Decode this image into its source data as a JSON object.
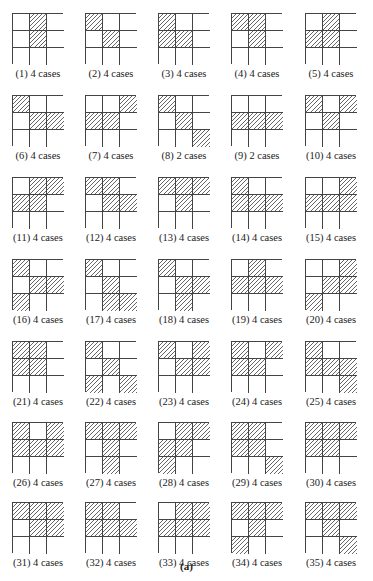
{
  "figure": {
    "caption": "(a)",
    "grid_size": 3,
    "hatch_color": "#666666",
    "line_color": "#444444",
    "panels": [
      {
        "label": "(1) 4 cases",
        "hatched": [
          [
            0,
            1
          ],
          [
            1,
            1
          ]
        ]
      },
      {
        "label": "(2) 4 cases",
        "hatched": [
          [
            0,
            0
          ],
          [
            1,
            1
          ]
        ]
      },
      {
        "label": "(3) 4 cases",
        "hatched": [
          [
            0,
            0
          ],
          [
            1,
            0
          ],
          [
            1,
            1
          ]
        ]
      },
      {
        "label": "(4) 4 cases",
        "hatched": [
          [
            0,
            0
          ],
          [
            0,
            1
          ],
          [
            1,
            1
          ]
        ]
      },
      {
        "label": "(5) 4 cases",
        "hatched": [
          [
            0,
            1
          ],
          [
            1,
            0
          ],
          [
            1,
            1
          ]
        ]
      },
      {
        "label": "(6) 4 cases",
        "hatched": [
          [
            0,
            0
          ],
          [
            1,
            1
          ],
          [
            1,
            2
          ]
        ]
      },
      {
        "label": "(7) 4 cases",
        "hatched": [
          [
            0,
            2
          ],
          [
            1,
            0
          ],
          [
            1,
            1
          ]
        ]
      },
      {
        "label": "(8) 2 cases",
        "hatched": [
          [
            0,
            0
          ],
          [
            1,
            1
          ],
          [
            2,
            2
          ]
        ]
      },
      {
        "label": "(9) 2 cases",
        "hatched": [
          [
            1,
            0
          ],
          [
            1,
            1
          ],
          [
            1,
            2
          ]
        ]
      },
      {
        "label": "(10) 4 cases",
        "hatched": [
          [
            0,
            0
          ],
          [
            0,
            2
          ],
          [
            1,
            1
          ]
        ]
      },
      {
        "label": "(11) 4 cases",
        "hatched": [
          [
            0,
            1
          ],
          [
            0,
            2
          ],
          [
            1,
            0
          ],
          [
            1,
            1
          ]
        ]
      },
      {
        "label": "(12) 4 cases",
        "hatched": [
          [
            0,
            0
          ],
          [
            0,
            1
          ],
          [
            1,
            1
          ],
          [
            1,
            2
          ]
        ]
      },
      {
        "label": "(13) 4 cases",
        "hatched": [
          [
            0,
            0
          ],
          [
            0,
            1
          ],
          [
            0,
            2
          ],
          [
            1,
            1
          ]
        ]
      },
      {
        "label": "(14) 4 cases",
        "hatched": [
          [
            0,
            0
          ],
          [
            1,
            0
          ],
          [
            1,
            1
          ],
          [
            1,
            2
          ]
        ]
      },
      {
        "label": "(15) 4 cases",
        "hatched": [
          [
            0,
            2
          ],
          [
            1,
            0
          ],
          [
            1,
            1
          ],
          [
            1,
            2
          ]
        ]
      },
      {
        "label": "(16) 4 cases",
        "hatched": [
          [
            0,
            0
          ],
          [
            1,
            1
          ],
          [
            1,
            2
          ],
          [
            2,
            0
          ]
        ]
      },
      {
        "label": "(17) 4 cases",
        "hatched": [
          [
            0,
            0
          ],
          [
            1,
            1
          ],
          [
            2,
            1
          ],
          [
            2,
            2
          ]
        ]
      },
      {
        "label": "(18) 4 cases",
        "hatched": [
          [
            0,
            0
          ],
          [
            1,
            1
          ],
          [
            1,
            2
          ],
          [
            2,
            1
          ]
        ]
      },
      {
        "label": "(19) 4 cases",
        "hatched": [
          [
            0,
            1
          ],
          [
            1,
            0
          ],
          [
            1,
            1
          ],
          [
            1,
            2
          ]
        ]
      },
      {
        "label": "(20) 4 cases",
        "hatched": [
          [
            0,
            2
          ],
          [
            1,
            1
          ],
          [
            1,
            2
          ],
          [
            2,
            0
          ]
        ]
      },
      {
        "label": "(21) 4 cases",
        "hatched": [
          [
            0,
            0
          ],
          [
            0,
            1
          ],
          [
            1,
            0
          ],
          [
            1,
            1
          ]
        ]
      },
      {
        "label": "(22) 4 cases",
        "hatched": [
          [
            0,
            0
          ],
          [
            1,
            1
          ],
          [
            2,
            0
          ],
          [
            2,
            2
          ]
        ]
      },
      {
        "label": "(23) 4 cases",
        "hatched": [
          [
            0,
            0
          ],
          [
            0,
            2
          ],
          [
            1,
            1
          ],
          [
            1,
            2
          ]
        ]
      },
      {
        "label": "(24) 4 cases",
        "hatched": [
          [
            0,
            0
          ],
          [
            0,
            2
          ],
          [
            1,
            0
          ],
          [
            1,
            1
          ]
        ]
      },
      {
        "label": "(25) 4 cases",
        "hatched": [
          [
            0,
            0
          ],
          [
            1,
            0
          ],
          [
            1,
            1
          ],
          [
            1,
            2
          ],
          [
            2,
            2
          ]
        ]
      },
      {
        "label": "(26) 4 cases",
        "hatched": [
          [
            0,
            0
          ],
          [
            0,
            2
          ],
          [
            1,
            0
          ],
          [
            1,
            1
          ],
          [
            1,
            2
          ]
        ]
      },
      {
        "label": "(27) 4 cases",
        "hatched": [
          [
            0,
            0
          ],
          [
            0,
            1
          ],
          [
            0,
            2
          ],
          [
            1,
            1
          ],
          [
            2,
            1
          ]
        ]
      },
      {
        "label": "(28) 4 cases",
        "hatched": [
          [
            0,
            1
          ],
          [
            0,
            2
          ],
          [
            1,
            0
          ],
          [
            1,
            1
          ],
          [
            2,
            0
          ]
        ]
      },
      {
        "label": "(29) 4 cases",
        "hatched": [
          [
            0,
            0
          ],
          [
            0,
            1
          ],
          [
            1,
            0
          ],
          [
            1,
            1
          ],
          [
            2,
            2
          ]
        ]
      },
      {
        "label": "(30) 4 cases",
        "hatched": [
          [
            0,
            0
          ],
          [
            0,
            1
          ],
          [
            0,
            2
          ],
          [
            1,
            0
          ],
          [
            1,
            1
          ]
        ]
      },
      {
        "label": "(31) 4 cases",
        "hatched": [
          [
            0,
            0
          ],
          [
            0,
            1
          ],
          [
            0,
            2
          ],
          [
            1,
            1
          ],
          [
            1,
            2
          ]
        ]
      },
      {
        "label": "(32) 4 cases",
        "hatched": [
          [
            0,
            0
          ],
          [
            0,
            1
          ],
          [
            1,
            0
          ],
          [
            1,
            1
          ],
          [
            1,
            2
          ]
        ]
      },
      {
        "label": "(33) 4 cases",
        "hatched": [
          [
            0,
            1
          ],
          [
            0,
            2
          ],
          [
            1,
            0
          ],
          [
            1,
            1
          ],
          [
            1,
            2
          ]
        ]
      },
      {
        "label": "(34) 4 cases",
        "hatched": [
          [
            0,
            0
          ],
          [
            0,
            1
          ],
          [
            0,
            2
          ],
          [
            1,
            1
          ],
          [
            2,
            0
          ]
        ]
      },
      {
        "label": "(35) 4 cases",
        "hatched": [
          [
            0,
            0
          ],
          [
            0,
            1
          ],
          [
            0,
            2
          ],
          [
            1,
            1
          ],
          [
            2,
            2
          ]
        ]
      }
    ]
  }
}
